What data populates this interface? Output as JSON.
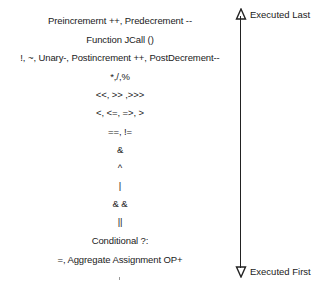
{
  "diagram": {
    "operators": [
      "Preincremernt ++, Predecrement --",
      "Function JCall ()",
      "!, ~, Unary-, Postincrement ++, PostDecrement--",
      "*,/,%",
      "<<, >> ,>>>",
      "<, <=, =>, >",
      "==, !=",
      "&",
      "^",
      "|",
      "& &",
      "||",
      "Conditional ?:",
      "=, Aggregate Assignment OP+"
    ],
    "axis": {
      "top_label": "Executed Last",
      "bottom_label": "Executed First",
      "color": "#222222"
    }
  }
}
